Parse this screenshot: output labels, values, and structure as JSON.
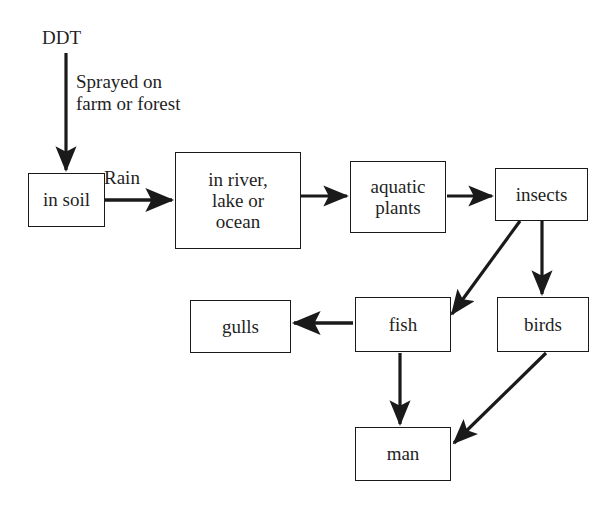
{
  "diagram": {
    "ink_color": "#1a1a1a",
    "background_color": "#ffffff",
    "nodes": [
      {
        "id": "in_soil",
        "label": "in soil"
      },
      {
        "id": "water",
        "label": "in river,\nlake or\nocean"
      },
      {
        "id": "aquatic",
        "label": "aquatic\nplants"
      },
      {
        "id": "insects",
        "label": "insects"
      },
      {
        "id": "gulls",
        "label": "gulls"
      },
      {
        "id": "fish",
        "label": "fish"
      },
      {
        "id": "birds",
        "label": "birds"
      },
      {
        "id": "man",
        "label": "man"
      }
    ],
    "free_labels": [
      {
        "id": "ddt",
        "text": "DDT"
      },
      {
        "id": "sprayed",
        "text": "Sprayed on\nfarm or forest"
      },
      {
        "id": "rain",
        "text": "Rain"
      }
    ],
    "edges": [
      {
        "from": "DDT",
        "to": "in soil",
        "label": "Sprayed on farm or forest"
      },
      {
        "from": "in soil",
        "to": "in river, lake or ocean",
        "label": "Rain"
      },
      {
        "from": "in river, lake or ocean",
        "to": "aquatic plants",
        "label": ""
      },
      {
        "from": "aquatic plants",
        "to": "insects",
        "label": ""
      },
      {
        "from": "insects",
        "to": "fish",
        "label": ""
      },
      {
        "from": "insects",
        "to": "birds",
        "label": ""
      },
      {
        "from": "fish",
        "to": "gulls",
        "label": ""
      },
      {
        "from": "fish",
        "to": "man",
        "label": ""
      },
      {
        "from": "birds",
        "to": "man",
        "label": ""
      }
    ]
  }
}
